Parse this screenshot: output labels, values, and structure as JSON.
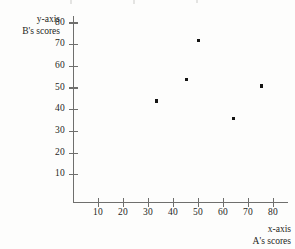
{
  "chart_data": {
    "type": "scatter",
    "title": "",
    "xlabel": "x-axis A's scores",
    "ylabel": "y-axis B's scores",
    "xlim": [
      0,
      86
    ],
    "ylim": [
      0,
      86
    ],
    "grid": false,
    "legend": false,
    "x": [
      33,
      45,
      50,
      64,
      75
    ],
    "y": [
      44,
      54,
      72,
      36,
      51
    ],
    "points": [
      {
        "x": 33,
        "y": 44
      },
      {
        "x": 45,
        "y": 54
      },
      {
        "x": 50,
        "y": 72
      },
      {
        "x": 64,
        "y": 36
      },
      {
        "x": 75,
        "y": 51
      }
    ],
    "xticks": [
      10,
      20,
      30,
      40,
      50,
      60,
      70,
      80
    ],
    "yticks": [
      10,
      20,
      30,
      40,
      50,
      60,
      70,
      80
    ],
    "xtick_labels": [
      "10",
      "20",
      "30",
      "40",
      "50",
      "60",
      "70",
      "80"
    ],
    "ytick_labels": [
      "10",
      "20",
      "30",
      "40",
      "50",
      "60",
      "70",
      "80"
    ],
    "marker_color": "#141413",
    "axis_color": "#6f6f6d"
  },
  "axes": {
    "y_caption_line1": "y-axis",
    "y_caption_line2": "B's scores",
    "x_caption_line1": "x-axis",
    "x_caption_line2": "A's scores"
  }
}
